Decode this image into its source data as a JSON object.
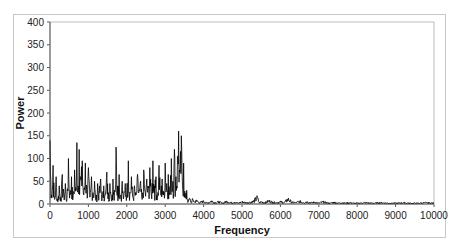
{
  "chart_data": {
    "type": "line",
    "title": "",
    "xlabel": "Frequency",
    "ylabel": "Power",
    "xlim": [
      0,
      10000
    ],
    "ylim": [
      0,
      400
    ],
    "x_ticks": [
      0,
      1000,
      2000,
      3000,
      4000,
      5000,
      6000,
      7000,
      8000,
      9000,
      10000
    ],
    "y_ticks": [
      0,
      50,
      100,
      150,
      200,
      250,
      300,
      350,
      400
    ],
    "grid": false,
    "legend": "none",
    "series": [
      {
        "name": "Power spectrum",
        "color": "#000000",
        "description": "Dense noisy spectrum; large power (mostly 0-100, peaks up to ~160) from 0 to ~3600 Hz, then drops to near zero (<20) from ~3700 to 10000 Hz",
        "points": [
          [
            0,
            140
          ],
          [
            40,
            20
          ],
          [
            80,
            85
          ],
          [
            120,
            10
          ],
          [
            160,
            60
          ],
          [
            200,
            5
          ],
          [
            240,
            40
          ],
          [
            280,
            15
          ],
          [
            320,
            65
          ],
          [
            360,
            20
          ],
          [
            400,
            45
          ],
          [
            440,
            8
          ],
          [
            480,
            100
          ],
          [
            520,
            25
          ],
          [
            560,
            60
          ],
          [
            600,
            12
          ],
          [
            640,
            75
          ],
          [
            680,
            30
          ],
          [
            700,
            135
          ],
          [
            730,
            40
          ],
          [
            760,
            120
          ],
          [
            800,
            60
          ],
          [
            840,
            95
          ],
          [
            880,
            20
          ],
          [
            920,
            90
          ],
          [
            960,
            35
          ],
          [
            1000,
            80
          ],
          [
            1040,
            15
          ],
          [
            1080,
            60
          ],
          [
            1120,
            25
          ],
          [
            1160,
            50
          ],
          [
            1200,
            10
          ],
          [
            1240,
            45
          ],
          [
            1280,
            30
          ],
          [
            1320,
            55
          ],
          [
            1360,
            15
          ],
          [
            1400,
            40
          ],
          [
            1440,
            20
          ],
          [
            1480,
            70
          ],
          [
            1520,
            25
          ],
          [
            1560,
            45
          ],
          [
            1600,
            10
          ],
          [
            1640,
            55
          ],
          [
            1680,
            30
          ],
          [
            1720,
            125
          ],
          [
            1760,
            40
          ],
          [
            1800,
            65
          ],
          [
            1840,
            20
          ],
          [
            1880,
            50
          ],
          [
            1920,
            15
          ],
          [
            1960,
            45
          ],
          [
            2000,
            30
          ],
          [
            2040,
            95
          ],
          [
            2080,
            25
          ],
          [
            2120,
            60
          ],
          [
            2160,
            15
          ],
          [
            2200,
            40
          ],
          [
            2240,
            20
          ],
          [
            2280,
            65
          ],
          [
            2320,
            30
          ],
          [
            2360,
            50
          ],
          [
            2400,
            10
          ],
          [
            2440,
            75
          ],
          [
            2480,
            25
          ],
          [
            2520,
            55
          ],
          [
            2560,
            35
          ],
          [
            2600,
            80
          ],
          [
            2640,
            20
          ],
          [
            2680,
            95
          ],
          [
            2720,
            40
          ],
          [
            2760,
            60
          ],
          [
            2800,
            15
          ],
          [
            2840,
            85
          ],
          [
            2880,
            30
          ],
          [
            2920,
            55
          ],
          [
            2960,
            20
          ],
          [
            3000,
            90
          ],
          [
            3040,
            45
          ],
          [
            3080,
            65
          ],
          [
            3120,
            25
          ],
          [
            3160,
            100
          ],
          [
            3200,
            50
          ],
          [
            3240,
            120
          ],
          [
            3280,
            60
          ],
          [
            3320,
            105
          ],
          [
            3350,
            160
          ],
          [
            3380,
            70
          ],
          [
            3420,
            150
          ],
          [
            3450,
            40
          ],
          [
            3480,
            90
          ],
          [
            3520,
            15
          ],
          [
            3560,
            30
          ],
          [
            3600,
            5
          ],
          [
            3640,
            12
          ],
          [
            3680,
            3
          ],
          [
            3720,
            10
          ],
          [
            3760,
            4
          ],
          [
            3800,
            8
          ],
          [
            3900,
            3
          ],
          [
            4000,
            6
          ],
          [
            4100,
            2
          ],
          [
            4200,
            7
          ],
          [
            4300,
            3
          ],
          [
            4400,
            5
          ],
          [
            4500,
            2
          ],
          [
            4600,
            6
          ],
          [
            4700,
            3
          ],
          [
            4800,
            4
          ],
          [
            4900,
            2
          ],
          [
            5000,
            5
          ],
          [
            5100,
            3
          ],
          [
            5200,
            4
          ],
          [
            5300,
            6
          ],
          [
            5400,
            14
          ],
          [
            5450,
            3
          ],
          [
            5500,
            5
          ],
          [
            5600,
            3
          ],
          [
            5700,
            7
          ],
          [
            5800,
            4
          ],
          [
            5900,
            3
          ],
          [
            6000,
            5
          ],
          [
            6100,
            3
          ],
          [
            6200,
            11
          ],
          [
            6300,
            4
          ],
          [
            6400,
            3
          ],
          [
            6500,
            6
          ],
          [
            6600,
            3
          ],
          [
            6700,
            5
          ],
          [
            6800,
            3
          ],
          [
            6900,
            4
          ],
          [
            7000,
            2
          ],
          [
            7100,
            5
          ],
          [
            7200,
            3
          ],
          [
            7300,
            2
          ],
          [
            7400,
            4
          ],
          [
            7500,
            2
          ],
          [
            7600,
            3
          ],
          [
            7700,
            2
          ],
          [
            7800,
            3
          ],
          [
            7900,
            2
          ],
          [
            8000,
            2
          ],
          [
            8200,
            3
          ],
          [
            8400,
            2
          ],
          [
            8600,
            3
          ],
          [
            8800,
            2
          ],
          [
            9000,
            2
          ],
          [
            9200,
            3
          ],
          [
            9400,
            2
          ],
          [
            9600,
            2
          ],
          [
            9800,
            3
          ],
          [
            10000,
            2
          ]
        ]
      }
    ]
  }
}
